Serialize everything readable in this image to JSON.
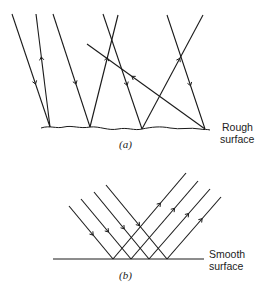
{
  "figure": {
    "panel_a": {
      "caption": "(a)",
      "surface_label_line1": "Rough",
      "surface_label_line2": "surface",
      "surface_type": "rough",
      "rays": [
        {
          "from": [
            12,
            14
          ],
          "to": [
            50,
            127
          ],
          "direction": "incident"
        },
        {
          "from": [
            50,
            127
          ],
          "to": [
            36,
            14
          ],
          "direction": "reflected"
        },
        {
          "from": [
            53,
            14
          ],
          "to": [
            90,
            127
          ],
          "direction": "incident"
        },
        {
          "from": [
            90,
            127
          ],
          "to": [
            118,
            15
          ],
          "direction": "reflected"
        },
        {
          "from": [
            103,
            14
          ],
          "to": [
            142,
            129
          ],
          "direction": "incident"
        },
        {
          "from": [
            142,
            129
          ],
          "to": [
            203,
            15
          ],
          "direction": "reflected"
        },
        {
          "from": [
            167,
            15
          ],
          "to": [
            205,
            129
          ],
          "direction": "incident"
        },
        {
          "from": [
            205,
            129
          ],
          "to": [
            87,
            44
          ],
          "direction": "reflected"
        }
      ]
    },
    "panel_b": {
      "caption": "(b)",
      "surface_label_line1": "Smooth",
      "surface_label_line2": "surface",
      "surface_type": "smooth",
      "rays": [
        {
          "from": [
            69,
            206
          ],
          "to": [
            113,
            259
          ],
          "direction": "incident"
        },
        {
          "from": [
            81,
            199
          ],
          "to": [
            131,
            259
          ],
          "direction": "incident"
        },
        {
          "from": [
            94,
            192
          ],
          "to": [
            149,
            259
          ],
          "direction": "incident"
        },
        {
          "from": [
            106,
            185
          ],
          "to": [
            167,
            259
          ],
          "direction": "incident"
        },
        {
          "from": [
            113,
            259
          ],
          "to": [
            186,
            173
          ],
          "direction": "reflected"
        },
        {
          "from": [
            131,
            259
          ],
          "to": [
            198,
            181
          ],
          "direction": "reflected"
        },
        {
          "from": [
            149,
            259
          ],
          "to": [
            210,
            189
          ],
          "direction": "reflected"
        },
        {
          "from": [
            167,
            259
          ],
          "to": [
            221,
            197
          ],
          "direction": "reflected"
        }
      ]
    },
    "colors": {
      "line": "#1a1a1a",
      "background": "#ffffff"
    }
  }
}
